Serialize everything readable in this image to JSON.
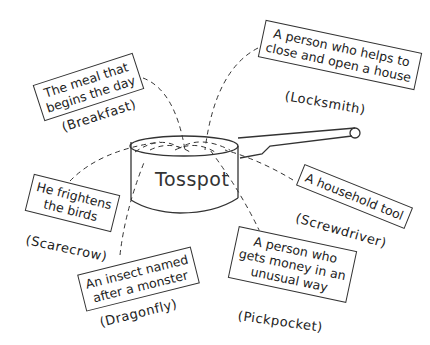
{
  "center": {
    "word": "Tosspot"
  },
  "clues": [
    {
      "id": "breakfast",
      "lines": [
        "The meal that",
        "begins the day"
      ],
      "answer": "(Breakfast)"
    },
    {
      "id": "locksmith",
      "lines": [
        "A person who helps to",
        "close and open a house"
      ],
      "answer": "(Locksmith)"
    },
    {
      "id": "scarecrow",
      "lines": [
        "He frightens",
        "the birds"
      ],
      "answer": "(Scarecrow)"
    },
    {
      "id": "screwdriver",
      "lines": [
        "A household tool"
      ],
      "answer": "(Screwdriver)"
    },
    {
      "id": "dragonfly",
      "lines": [
        "An insect named",
        "after a monster"
      ],
      "answer": "(Dragonfly)"
    },
    {
      "id": "pickpocket",
      "lines": [
        "A person who",
        "gets money in an",
        "unusual way"
      ],
      "answer": "(Pickpocket)"
    }
  ]
}
